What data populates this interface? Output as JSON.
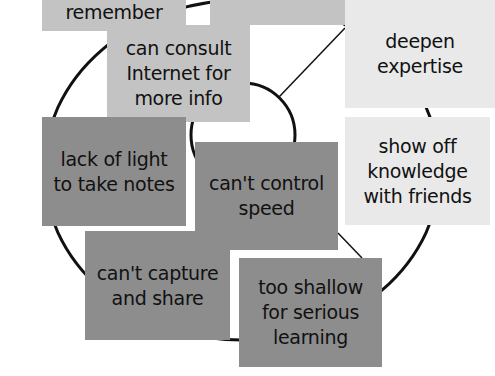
{
  "diagram": {
    "type": "affinity-map over circle",
    "colors": {
      "pale_note": "#e9e9e9",
      "light_note": "#c3c3c3",
      "dark_note": "#8d8d8d",
      "outline": "#111111"
    },
    "notes": [
      {
        "id": "remember",
        "text": "remember",
        "tone": "light"
      },
      {
        "id": "top-center",
        "text": "",
        "tone": "light"
      },
      {
        "id": "consult-internet",
        "text": "can consult\nInternet for\nmore info",
        "tone": "light"
      },
      {
        "id": "deepen-expertise",
        "text": "deepen\nexpertise",
        "tone": "pale"
      },
      {
        "id": "show-off",
        "text": "show off\nknowledge\nwith friends",
        "tone": "pale"
      },
      {
        "id": "lack-of-light",
        "text": "lack of light\nto take notes",
        "tone": "dark"
      },
      {
        "id": "cant-control-speed",
        "text": "can't control\nspeed",
        "tone": "dark"
      },
      {
        "id": "cant-capture",
        "text": "can't capture\nand share",
        "tone": "dark"
      },
      {
        "id": "too-shallow",
        "text": "too shallow\nfor serious\nlearning",
        "tone": "dark"
      }
    ]
  }
}
